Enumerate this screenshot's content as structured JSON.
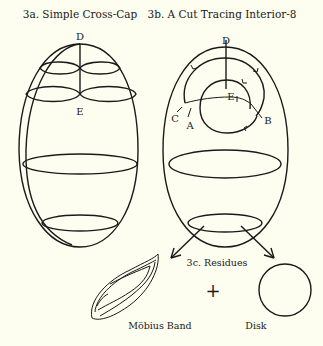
{
  "figure": {
    "background": "#fdfdf0",
    "ink": "#1a1a1a",
    "panel_a": {
      "title": "3a. Simple Cross-Cap",
      "points": {
        "top": "D",
        "bottom": "E"
      }
    },
    "panel_b": {
      "title": "3b. A Cut Tracing Interior-8",
      "points": {
        "top": "D",
        "center": "E",
        "left_outer": "C",
        "left_inner": "A",
        "right": "B"
      }
    },
    "panel_c": {
      "title": "3c. Residues",
      "operator": "+",
      "left_label": "Möbius Band",
      "right_label": "Disk"
    }
  }
}
